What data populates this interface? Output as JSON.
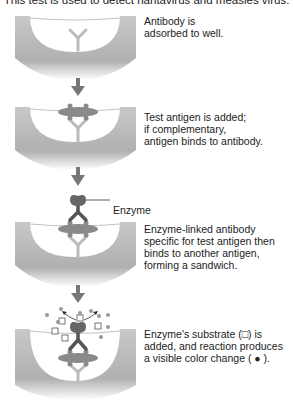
{
  "caption": "This test is used to detect hantavirus and measles virus.",
  "steps": [
    {
      "lines": [
        "Antibody is",
        "adsorbed to well."
      ]
    },
    {
      "lines": [
        "Test antigen is added;",
        "if complementary,",
        "antigen binds to antibody."
      ]
    },
    {
      "lines": [
        "Enzyme-linked antibody",
        "specific for test antigen then",
        "binds to another antigen,",
        "forming a sandwich."
      ]
    },
    {
      "lines": [
        "Enzyme's substrate (□) is",
        "added, and reaction produces",
        "a visible color change ( ● )."
      ]
    }
  ],
  "labels": {
    "enzyme": "Enzyme"
  },
  "colors": {
    "well": "#b8b8b8",
    "antibody": "#c4c4c4",
    "antigen": "#8a8a8a",
    "enzyme_antibody": "#555555",
    "arrow": "#777777",
    "product": "#999999"
  }
}
